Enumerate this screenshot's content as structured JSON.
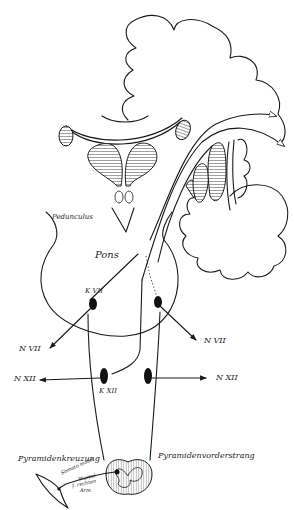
{
  "diagram": {
    "type": "anatomical-schematic",
    "colors": {
      "ink": "#1a1a1a",
      "background": "#ffffff",
      "hatch": "#888888"
    },
    "labels": {
      "pedunculus": "Pedunculus",
      "pons": "Pons",
      "k_vii": "K VII",
      "n_vii_left": "N VII",
      "n_vii_right": "N VII",
      "n_xii_left": "N XII",
      "n_xii_right": "N XII",
      "k_xii": "K XII",
      "pyramidenkreuzung": "Pyramidenkreuzung",
      "pyramidenvorderstrang": "Pyramidenvorderstrang",
      "somato_motor": "Somato motor",
      "wurzel": "Wurzel",
      "f_rechten": "f. rechten",
      "arm": "Arm"
    }
  }
}
